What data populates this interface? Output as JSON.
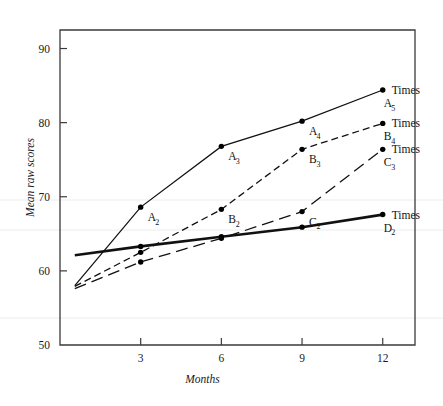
{
  "chart_data": {
    "type": "line",
    "title": "",
    "xlabel": "Months",
    "ylabel": "Mean raw scores",
    "xlim": [
      0,
      13.2
    ],
    "ylim": [
      50,
      92.5
    ],
    "xticks": [
      3,
      6,
      9,
      12
    ],
    "yticks": [
      50,
      60,
      70,
      80,
      90
    ],
    "grid": false,
    "legend_position": "right-inline",
    "series": [
      {
        "name": "A",
        "end_label": "Times",
        "end_label_sub": "A₅",
        "style": "solid-thin",
        "x": [
          0.55,
          3,
          6,
          9,
          12
        ],
        "y": [
          58.0,
          68.6,
          76.8,
          80.2,
          84.4
        ],
        "point_labels": [
          "",
          "A₂",
          "A₃",
          "A₄",
          "A₅"
        ],
        "point_label_text": [
          "",
          "A",
          "A",
          "A",
          "A"
        ],
        "point_label_sub": [
          "",
          "2",
          "3",
          "4",
          "5"
        ]
      },
      {
        "name": "B",
        "end_label": "Times",
        "end_label_sub": "B₄",
        "style": "short-dash",
        "x": [
          0.55,
          3,
          6,
          9,
          12
        ],
        "y": [
          57.9,
          62.5,
          68.3,
          76.4,
          79.9
        ],
        "point_labels": [
          "",
          "",
          "B₂",
          "B₃",
          "B₄"
        ],
        "point_label_text": [
          "",
          "",
          "B",
          "B",
          "B"
        ],
        "point_label_sub": [
          "",
          "",
          "2",
          "3",
          "4"
        ]
      },
      {
        "name": "C",
        "end_label": "Times",
        "end_label_sub": "C₃",
        "style": "long-dash",
        "x": [
          0.55,
          3,
          6,
          9,
          12
        ],
        "y": [
          57.6,
          61.2,
          64.4,
          68.0,
          76.4
        ],
        "point_labels": [
          "",
          "",
          "",
          "C₂",
          "C₃"
        ],
        "point_label_text": [
          "",
          "",
          "",
          "C",
          "C"
        ],
        "point_label_sub": [
          "",
          "",
          "",
          "2",
          "3"
        ]
      },
      {
        "name": "D",
        "end_label": "Times",
        "end_label_sub": "D₂",
        "style": "solid-thick",
        "x": [
          0.55,
          3,
          6,
          9,
          12
        ],
        "y": [
          62.1,
          63.3,
          64.6,
          65.9,
          67.6
        ],
        "point_labels": [
          "",
          "",
          "",
          "",
          "D₂"
        ],
        "point_label_text": [
          "",
          "",
          "",
          "",
          "D"
        ],
        "point_label_sub": [
          "",
          "",
          "",
          "",
          "2"
        ]
      }
    ]
  },
  "axes": {
    "y_title": "Mean raw scores",
    "x_title": "Months",
    "y_tick_labels": [
      "90",
      "80",
      "70",
      "60",
      "50"
    ],
    "x_tick_labels": [
      "3",
      "6",
      "9",
      "12"
    ]
  },
  "annotations": {
    "series_end_labels": [
      {
        "text": "Times",
        "sub_letter": "A",
        "sub_digit": "5"
      },
      {
        "text": "Times",
        "sub_letter": "B",
        "sub_digit": "4"
      },
      {
        "text": "Times",
        "sub_letter": "C",
        "sub_digit": "3"
      },
      {
        "text": "Times",
        "sub_letter": "D",
        "sub_digit": "2"
      }
    ],
    "inline_point_labels": [
      {
        "letter": "A",
        "digit": "2"
      },
      {
        "letter": "A",
        "digit": "3"
      },
      {
        "letter": "A",
        "digit": "4"
      },
      {
        "letter": "B",
        "digit": "2"
      },
      {
        "letter": "B",
        "digit": "3"
      },
      {
        "letter": "C",
        "digit": "2"
      }
    ]
  },
  "colors": {
    "line": "#111111",
    "axis": "#3a3a3a",
    "text": "#111111",
    "background": "#ffffff"
  }
}
